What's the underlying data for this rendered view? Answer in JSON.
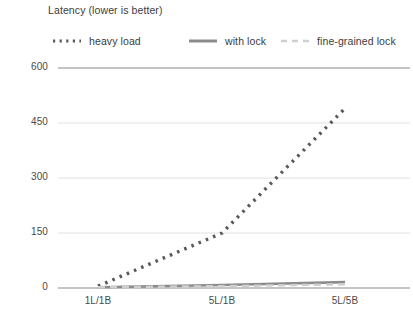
{
  "chart_data": {
    "type": "line",
    "title": "Latency (lower is better)",
    "xlabel": "",
    "ylabel": "",
    "categories": [
      "1L/1B",
      "5L/1B",
      "5L/5B"
    ],
    "yticks": [
      0,
      150,
      300,
      450,
      600
    ],
    "ylim": [
      0,
      600
    ],
    "grid": true,
    "legend_position": "top",
    "series": [
      {
        "name": "heavy load",
        "values": [
          5,
          150,
          490
        ],
        "style": "dotted",
        "color": "#595959"
      },
      {
        "name": "with lock",
        "values": [
          2,
          8,
          16
        ],
        "style": "solid",
        "color": "#8c8c8c"
      },
      {
        "name": "fine-grained lock",
        "values": [
          2,
          5,
          10
        ],
        "style": "dashed",
        "color": "#cfcfcf"
      }
    ]
  },
  "axis": {
    "ytick_labels": [
      "600",
      "450",
      "300",
      "150",
      "0"
    ],
    "xtick_labels": [
      "1L/1B",
      "5L/1B",
      "5L/5B"
    ]
  },
  "colors": {
    "heavy_load": "#595959",
    "with_lock": "#8c8c8c",
    "fine_grained_lock": "#cfcfcf",
    "gridline": "#e2e2e2",
    "axis_line": "#8a8a8a",
    "text": "#404040",
    "background": "#ffffff"
  }
}
